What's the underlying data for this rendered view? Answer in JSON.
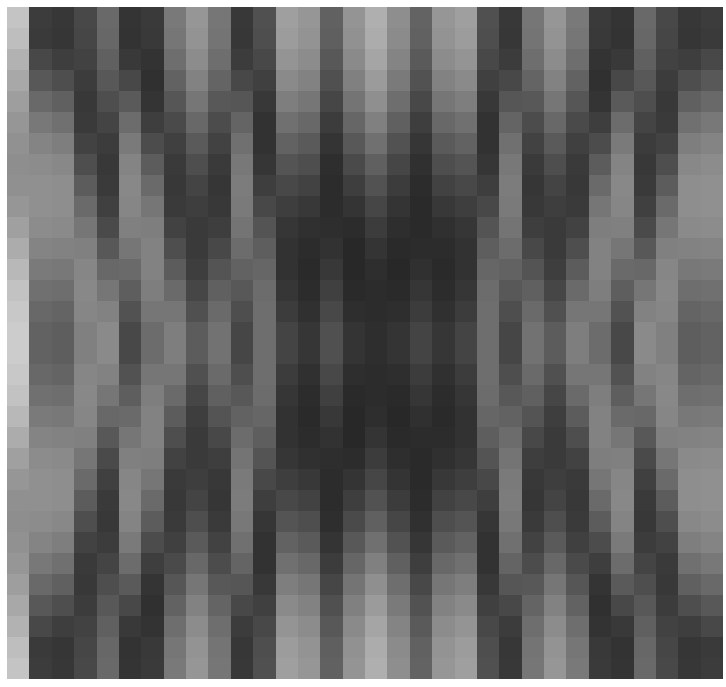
{
  "figure": {
    "width": 726,
    "height": 687,
    "background_color": "#ffffff",
    "margin_left": 7,
    "margin_top": 7,
    "margin_right": 3,
    "margin_bottom": 8
  },
  "axes": {
    "x": 7,
    "y": 7,
    "width": 716,
    "height": 672,
    "frame_visible": false,
    "xticks_visible": false,
    "yticks_visible": false,
    "title": "",
    "xlabel": "",
    "ylabel": ""
  },
  "chart_data": {
    "type": "heatmap",
    "title": "",
    "xlabel": "",
    "ylabel": "",
    "colormap": "gray",
    "interpolation": "nearest",
    "aspect": "auto",
    "origin": "upper",
    "grid": false,
    "legend": null,
    "colorbar": false,
    "vmin": 0,
    "vmax": 255,
    "n_rows": 32,
    "n_cols": 32,
    "xlim": [
      0,
      32
    ],
    "ylim": [
      32,
      0
    ],
    "xticks": [],
    "yticks": [],
    "xticklabels": [],
    "yticklabels": [],
    "cell_width_px": 22.375,
    "cell_height_px": 21.0,
    "values": [
      [
        196,
        60,
        55,
        72,
        105,
        52,
        58,
        121,
        150,
        118,
        56,
        80,
        159,
        150,
        97,
        148,
        175,
        142,
        99,
        150,
        159,
        80,
        56,
        118,
        150,
        121,
        58,
        52,
        105,
        72,
        55,
        60
      ],
      [
        190,
        58,
        54,
        70,
        103,
        51,
        57,
        118,
        147,
        116,
        55,
        78,
        156,
        147,
        95,
        145,
        172,
        139,
        97,
        147,
        156,
        78,
        55,
        116,
        147,
        118,
        57,
        51,
        103,
        70,
        54,
        58
      ],
      [
        178,
        72,
        62,
        66,
        96,
        57,
        51,
        110,
        140,
        110,
        60,
        72,
        148,
        140,
        88,
        138,
        165,
        132,
        90,
        140,
        148,
        72,
        60,
        110,
        140,
        110,
        51,
        57,
        96,
        66,
        62,
        72
      ],
      [
        168,
        88,
        78,
        60,
        88,
        72,
        48,
        98,
        130,
        100,
        72,
        64,
        138,
        130,
        80,
        128,
        155,
        122,
        82,
        130,
        138,
        64,
        72,
        100,
        130,
        98,
        48,
        72,
        88,
        60,
        78,
        88
      ],
      [
        158,
        105,
        96,
        56,
        78,
        90,
        52,
        86,
        118,
        88,
        86,
        56,
        126,
        118,
        70,
        116,
        143,
        110,
        72,
        118,
        126,
        56,
        86,
        88,
        118,
        86,
        52,
        90,
        78,
        56,
        96,
        105
      ],
      [
        150,
        120,
        112,
        58,
        68,
        108,
        62,
        74,
        104,
        76,
        100,
        50,
        112,
        104,
        60,
        102,
        128,
        96,
        62,
        104,
        112,
        50,
        100,
        76,
        104,
        74,
        62,
        108,
        68,
        58,
        112,
        120
      ],
      [
        145,
        132,
        126,
        66,
        60,
        122,
        76,
        64,
        90,
        66,
        112,
        50,
        98,
        90,
        52,
        88,
        112,
        82,
        54,
        90,
        98,
        50,
        112,
        66,
        90,
        64,
        76,
        122,
        60,
        66,
        126,
        132
      ],
      [
        142,
        140,
        136,
        78,
        56,
        132,
        92,
        58,
        78,
        58,
        120,
        54,
        84,
        78,
        46,
        74,
        96,
        70,
        48,
        78,
        84,
        54,
        120,
        58,
        78,
        58,
        92,
        132,
        56,
        78,
        136,
        140
      ],
      [
        144,
        144,
        142,
        92,
        58,
        136,
        106,
        56,
        68,
        54,
        124,
        62,
        72,
        66,
        44,
        62,
        82,
        60,
        44,
        66,
        72,
        62,
        124,
        54,
        68,
        56,
        106,
        136,
        58,
        92,
        142,
        144
      ],
      [
        150,
        144,
        142,
        106,
        64,
        134,
        118,
        58,
        62,
        56,
        122,
        72,
        62,
        56,
        44,
        52,
        70,
        52,
        42,
        56,
        62,
        72,
        122,
        56,
        62,
        58,
        118,
        134,
        64,
        106,
        142,
        144
      ],
      [
        160,
        140,
        138,
        118,
        74,
        128,
        126,
        66,
        58,
        62,
        116,
        84,
        54,
        48,
        46,
        44,
        60,
        46,
        42,
        48,
        54,
        84,
        116,
        62,
        58,
        66,
        126,
        128,
        74,
        118,
        138,
        140
      ],
      [
        172,
        132,
        130,
        128,
        88,
        118,
        130,
        78,
        58,
        72,
        108,
        94,
        50,
        44,
        50,
        40,
        52,
        42,
        44,
        44,
        50,
        94,
        108,
        72,
        58,
        78,
        130,
        118,
        88,
        128,
        130,
        132
      ],
      [
        184,
        122,
        120,
        134,
        104,
        106,
        130,
        92,
        62,
        84,
        98,
        102,
        50,
        42,
        56,
        40,
        46,
        40,
        48,
        42,
        50,
        102,
        98,
        84,
        62,
        92,
        130,
        106,
        104,
        134,
        120,
        122
      ],
      [
        194,
        112,
        110,
        136,
        118,
        94,
        126,
        106,
        70,
        96,
        88,
        108,
        54,
        44,
        64,
        42,
        44,
        42,
        54,
        44,
        54,
        108,
        88,
        96,
        70,
        106,
        126,
        94,
        118,
        136,
        110,
        112
      ],
      [
        200,
        104,
        100,
        134,
        130,
        82,
        118,
        118,
        80,
        106,
        78,
        110,
        60,
        48,
        72,
        46,
        44,
        46,
        60,
        48,
        60,
        110,
        78,
        106,
        80,
        118,
        118,
        82,
        130,
        134,
        100,
        104
      ],
      [
        204,
        98,
        94,
        128,
        138,
        72,
        108,
        126,
        92,
        114,
        70,
        110,
        68,
        54,
        80,
        52,
        46,
        52,
        68,
        54,
        68,
        110,
        70,
        114,
        92,
        126,
        108,
        72,
        138,
        128,
        94,
        98
      ],
      [
        204,
        98,
        94,
        128,
        138,
        72,
        108,
        126,
        92,
        114,
        70,
        110,
        68,
        54,
        80,
        52,
        46,
        52,
        68,
        54,
        68,
        110,
        70,
        114,
        92,
        126,
        108,
        72,
        138,
        128,
        94,
        98
      ],
      [
        200,
        104,
        100,
        134,
        130,
        82,
        118,
        118,
        80,
        106,
        78,
        110,
        60,
        48,
        72,
        46,
        44,
        46,
        60,
        48,
        60,
        110,
        78,
        106,
        80,
        118,
        118,
        82,
        130,
        134,
        100,
        104
      ],
      [
        194,
        112,
        110,
        136,
        118,
        94,
        126,
        106,
        70,
        96,
        88,
        108,
        54,
        44,
        64,
        42,
        44,
        42,
        54,
        44,
        54,
        108,
        88,
        96,
        70,
        106,
        126,
        94,
        118,
        136,
        110,
        112
      ],
      [
        184,
        122,
        120,
        134,
        104,
        106,
        130,
        92,
        62,
        84,
        98,
        102,
        50,
        42,
        56,
        40,
        46,
        40,
        48,
        42,
        50,
        102,
        98,
        84,
        62,
        92,
        130,
        106,
        104,
        134,
        120,
        122
      ],
      [
        172,
        132,
        130,
        128,
        88,
        118,
        130,
        78,
        58,
        72,
        108,
        94,
        50,
        44,
        50,
        40,
        52,
        42,
        44,
        44,
        50,
        94,
        108,
        72,
        58,
        78,
        130,
        118,
        88,
        128,
        130,
        132
      ],
      [
        160,
        140,
        138,
        118,
        74,
        128,
        126,
        66,
        58,
        62,
        116,
        84,
        54,
        48,
        46,
        44,
        60,
        46,
        42,
        48,
        54,
        84,
        116,
        62,
        58,
        66,
        126,
        128,
        74,
        118,
        138,
        140
      ],
      [
        150,
        144,
        142,
        106,
        64,
        134,
        118,
        58,
        62,
        56,
        122,
        72,
        62,
        56,
        44,
        52,
        70,
        52,
        42,
        56,
        62,
        72,
        122,
        56,
        62,
        58,
        118,
        134,
        64,
        106,
        142,
        144
      ],
      [
        144,
        144,
        142,
        92,
        58,
        136,
        106,
        56,
        68,
        54,
        124,
        62,
        72,
        66,
        44,
        62,
        82,
        60,
        44,
        66,
        72,
        62,
        124,
        54,
        68,
        56,
        106,
        136,
        58,
        92,
        142,
        144
      ],
      [
        142,
        140,
        136,
        78,
        56,
        132,
        92,
        58,
        78,
        58,
        120,
        54,
        84,
        78,
        46,
        74,
        96,
        70,
        48,
        78,
        84,
        54,
        120,
        58,
        78,
        58,
        92,
        132,
        56,
        78,
        136,
        140
      ],
      [
        145,
        132,
        126,
        66,
        60,
        122,
        76,
        64,
        90,
        66,
        112,
        50,
        98,
        90,
        52,
        88,
        112,
        82,
        54,
        90,
        98,
        50,
        112,
        66,
        90,
        64,
        76,
        122,
        60,
        66,
        126,
        132
      ],
      [
        150,
        120,
        112,
        58,
        68,
        108,
        62,
        74,
        104,
        76,
        100,
        50,
        112,
        104,
        60,
        102,
        128,
        96,
        62,
        104,
        112,
        50,
        100,
        76,
        104,
        74,
        62,
        108,
        68,
        58,
        112,
        120
      ],
      [
        158,
        105,
        96,
        56,
        78,
        90,
        52,
        86,
        118,
        88,
        86,
        56,
        126,
        118,
        70,
        116,
        143,
        110,
        72,
        118,
        126,
        56,
        86,
        88,
        118,
        86,
        52,
        90,
        78,
        56,
        96,
        105
      ],
      [
        168,
        88,
        78,
        60,
        88,
        72,
        48,
        98,
        130,
        100,
        72,
        64,
        138,
        130,
        80,
        128,
        155,
        122,
        82,
        130,
        138,
        64,
        72,
        100,
        130,
        98,
        48,
        72,
        88,
        60,
        78,
        88
      ],
      [
        178,
        72,
        62,
        66,
        96,
        57,
        51,
        110,
        140,
        110,
        60,
        72,
        148,
        140,
        88,
        138,
        165,
        132,
        90,
        140,
        148,
        72,
        60,
        110,
        140,
        110,
        51,
        57,
        96,
        66,
        62,
        72
      ],
      [
        190,
        58,
        54,
        70,
        103,
        51,
        57,
        118,
        147,
        116,
        55,
        78,
        156,
        147,
        95,
        145,
        172,
        139,
        97,
        147,
        156,
        78,
        55,
        116,
        147,
        118,
        57,
        51,
        103,
        70,
        54,
        58
      ],
      [
        196,
        60,
        55,
        72,
        105,
        52,
        58,
        121,
        150,
        118,
        56,
        80,
        159,
        150,
        97,
        148,
        175,
        142,
        99,
        150,
        159,
        80,
        56,
        118,
        150,
        121,
        58,
        52,
        105,
        72,
        55,
        60
      ]
    ]
  }
}
